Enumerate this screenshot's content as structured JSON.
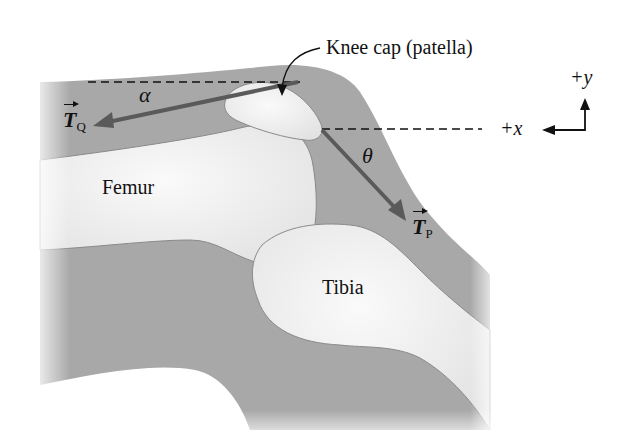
{
  "figure": {
    "labels": {
      "patella": "Knee cap (patella)",
      "femur": "Femur",
      "tibia": "Tibia",
      "alpha": "α",
      "theta": "θ",
      "tq_main": "T",
      "tq_sub": "Q",
      "tp_main": "T",
      "tp_sub": "P",
      "plus_y": "+y",
      "plus_x": "+x"
    },
    "colors": {
      "tissue": "#a9a9a9",
      "bone": "#ececec",
      "arrow": "#5a5a5a",
      "ink": "#111111"
    }
  }
}
